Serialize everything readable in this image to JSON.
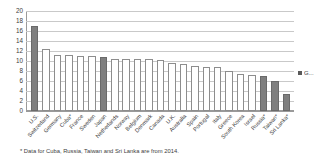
{
  "chart_data": {
    "type": "bar",
    "title": "",
    "subtitle": "",
    "xlabel": "",
    "ylabel": "",
    "ylim": [
      0,
      20
    ],
    "ytick_step": 2,
    "yticks": [
      "20",
      "18",
      "16",
      "14",
      "12",
      "10",
      "8",
      "6",
      "4",
      "2",
      "0"
    ],
    "grid": true,
    "legend_position": "right",
    "categories": [
      "U.S.",
      "Switzerland",
      "Germany",
      "Cuba*",
      "France",
      "Sweden",
      "Japan",
      "Netherlands",
      "Norway",
      "Belgium",
      "Denmark",
      "Canada",
      "U.K.",
      "Australia",
      "Spain",
      "Portugal",
      "Italy",
      "Greece",
      "South Korea",
      "Israel",
      "Russia*",
      "Taiwan*",
      "Sri Lanka*"
    ],
    "values": [
      17.1,
      12.4,
      11.3,
      11.2,
      11.1,
      11.1,
      10.9,
      10.4,
      10.4,
      10.4,
      10.4,
      10.2,
      9.7,
      9.5,
      9.0,
      8.8,
      8.8,
      8.1,
      7.4,
      7.2,
      7.0,
      6.1,
      3.5
    ],
    "highlighted": [
      "U.S.",
      "Japan",
      "Russia*",
      "Taiwan*",
      "Sri Lanka*"
    ],
    "series": [
      {
        "name": "G...",
        "values": [
          17.1,
          12.4,
          11.3,
          11.2,
          11.1,
          11.1,
          10.9,
          10.4,
          10.4,
          10.4,
          10.4,
          10.2,
          9.7,
          9.5,
          9.0,
          8.8,
          8.8,
          8.1,
          7.4,
          7.2,
          7.0,
          6.1,
          3.5
        ]
      }
    ],
    "colors": {
      "bar_default_fill": "#ffffff",
      "bar_default_border": "#8d8d8d",
      "bar_highlight_fill": "#7f7f7f",
      "gridline": "#c9c9c9",
      "axis": "#9a9a9a",
      "text": "#3c3c3c"
    }
  },
  "legend": {
    "label": "G...",
    "swatch_color": "#595959"
  },
  "footnote": {
    "text": "* Data for Cuba, Russia, Taiwan and Sri Lanka are from 2014."
  }
}
